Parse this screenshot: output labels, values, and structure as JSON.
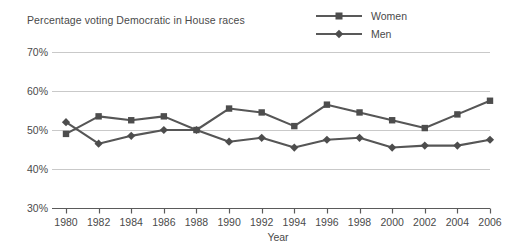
{
  "chart_data": {
    "type": "line",
    "title": "Percentage voting Democratic in House races",
    "xlabel": "Year",
    "ylabel": "",
    "grid": true,
    "legend_position": "top-right",
    "categories": [
      1980,
      1982,
      1984,
      1986,
      1988,
      1990,
      1992,
      1994,
      1996,
      1998,
      2000,
      2002,
      2004,
      2006
    ],
    "x": [
      "1980",
      "1982",
      "1984",
      "1986",
      "1988",
      "1990",
      "1992",
      "1994",
      "1996",
      "1998",
      "2000",
      "2002",
      "2004",
      "2006"
    ],
    "xlim": [
      1980,
      2006
    ],
    "ylim": [
      30,
      70
    ],
    "ytick_labels": [
      "70%",
      "60%",
      "50%",
      "40%",
      "30%"
    ],
    "ytick_values": [
      70,
      60,
      50,
      40,
      30
    ],
    "series": [
      {
        "name": "Women",
        "marker": "square",
        "color": "#565656",
        "values": [
          49,
          53.5,
          52.5,
          53.5,
          50,
          55.5,
          54.5,
          51,
          56.5,
          54.5,
          52.5,
          50.5,
          54,
          57.5
        ]
      },
      {
        "name": "Men",
        "marker": "diamond",
        "color": "#565656",
        "values": [
          52,
          46.5,
          48.5,
          50,
          50,
          47,
          48,
          45.5,
          47.5,
          48,
          45.5,
          46,
          46,
          47.5
        ]
      }
    ]
  },
  "legend": {
    "items": [
      {
        "label": "Women"
      },
      {
        "label": "Men"
      }
    ]
  },
  "colors": {
    "line": "#565656",
    "marker": "#4d4d4d",
    "grid": "#c9c9c9",
    "axis": "#5a5a5a",
    "text": "#4a4a4a",
    "background": "#ffffff"
  }
}
